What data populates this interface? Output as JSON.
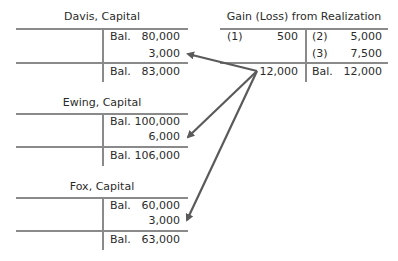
{
  "accounts": {
    "davis": {
      "title": "Davis, Capital",
      "credit": [
        {
          "label": "Bal.",
          "value": "80,000"
        },
        {
          "label": "",
          "value": "3,000"
        }
      ],
      "balance": {
        "label": "Bal.",
        "value": "83,000"
      }
    },
    "ewing": {
      "title": "Ewing, Capital",
      "credit": [
        {
          "label": "Bal.",
          "value": "100,000"
        },
        {
          "label": "",
          "value": "6,000"
        }
      ],
      "balance": {
        "label": "Bal.",
        "value": "106,000"
      }
    },
    "fox": {
      "title": "Fox, Capital",
      "credit": [
        {
          "label": "Bal.",
          "value": "60,000"
        },
        {
          "label": "",
          "value": "3,000"
        }
      ],
      "balance": {
        "label": "Bal.",
        "value": "63,000"
      }
    },
    "gain_loss": {
      "title": "Gain (Loss) from Realization",
      "debit": [
        {
          "label": "(1)",
          "value": "500"
        }
      ],
      "debit_closing": {
        "label": "",
        "value": "12,000"
      },
      "credit": [
        {
          "label": "(2)",
          "value": "5,000"
        },
        {
          "label": "(3)",
          "value": "7,500"
        }
      ],
      "balance": {
        "label": "Bal.",
        "value": "12,000"
      }
    }
  },
  "arrows": {
    "color": "#5a5a5a",
    "from": "gain-loss-closing-12000",
    "to": [
      "davis-3000",
      "ewing-6000",
      "fox-3000"
    ]
  }
}
